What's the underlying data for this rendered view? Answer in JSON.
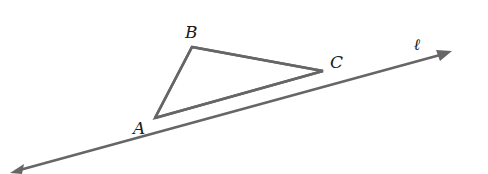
{
  "figure": {
    "line": {
      "label": "ℓ",
      "arrows": "both"
    },
    "triangle": {
      "vertices": [
        {
          "name": "A"
        },
        {
          "name": "B"
        },
        {
          "name": "C"
        }
      ]
    },
    "colors": {
      "stroke": "#666666",
      "text": "#1a1a1a",
      "background": "#ffffff"
    }
  }
}
